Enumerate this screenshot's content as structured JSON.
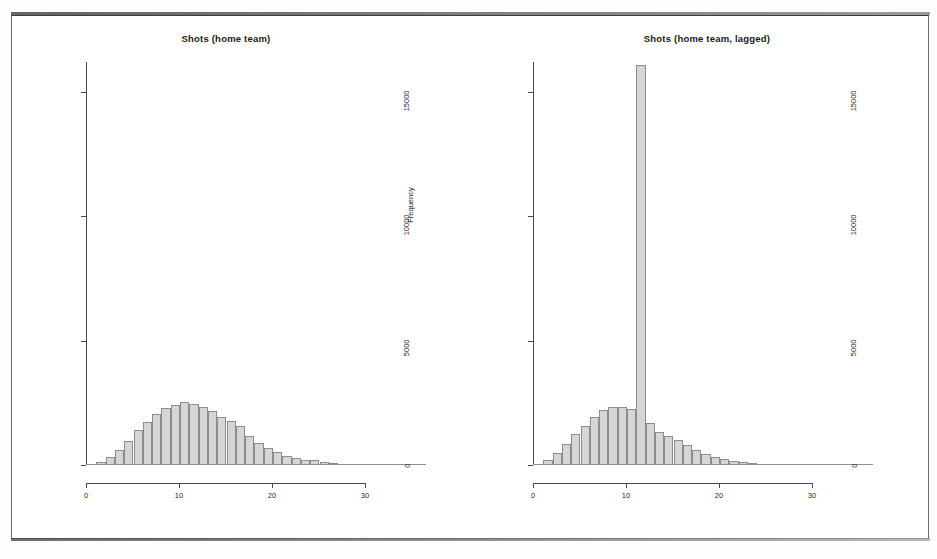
{
  "figure": {
    "background": "#ffffff",
    "frame_color": "#6a6a6a",
    "bar_fill": "#d6d6d6",
    "bar_border": "#8c8c8c",
    "axis_color": "#4a4a4a"
  },
  "chart_data": [
    {
      "type": "bar",
      "id": "shots-home-team",
      "title": "Shots (home team)",
      "xlabel": "",
      "ylabel": "Frequency",
      "xlim": [
        0,
        35.5
      ],
      "ylim": [
        0,
        16200
      ],
      "xticks": [
        0,
        10,
        20,
        30
      ],
      "xtick_labels": [
        "0",
        "10",
        "20",
        "30"
      ],
      "yticks": [
        0,
        5000,
        10000,
        15000
      ],
      "ytick_labels": [
        "0",
        "5000",
        "10000",
        "15000"
      ],
      "grid": false,
      "legend": "none",
      "bin_width": 1,
      "categories": [
        0,
        1,
        2,
        3,
        4,
        5,
        6,
        7,
        8,
        9,
        10,
        11,
        12,
        13,
        14,
        15,
        16,
        17,
        18,
        19,
        20,
        21,
        22,
        23,
        24,
        25,
        26,
        27,
        28,
        29,
        30,
        31,
        32,
        33,
        34,
        35
      ],
      "values": [
        40,
        110,
        330,
        620,
        980,
        1390,
        1720,
        2060,
        2300,
        2430,
        2550,
        2470,
        2330,
        2180,
        1930,
        1760,
        1560,
        1170,
        890,
        690,
        520,
        380,
        300,
        210,
        190,
        110,
        70,
        45,
        30,
        18,
        12,
        8,
        5,
        3,
        2,
        1
      ]
    },
    {
      "type": "bar",
      "id": "shots-home-team-lagged",
      "title": "Shots (home team, lagged)",
      "xlabel": "",
      "ylabel": "Frequency",
      "xlim": [
        0,
        35.5
      ],
      "ylim": [
        0,
        16200
      ],
      "xticks": [
        0,
        10,
        20,
        30
      ],
      "xtick_labels": [
        "0",
        "10",
        "20",
        "30"
      ],
      "yticks": [
        0,
        5000,
        10000,
        15000
      ],
      "ytick_labels": [
        "0",
        "5000",
        "10000",
        "15000"
      ],
      "grid": false,
      "legend": "none",
      "bin_width": 1,
      "spike_bin": 11,
      "spike_clipped": true,
      "categories": [
        0,
        1,
        2,
        3,
        4,
        5,
        6,
        7,
        8,
        9,
        10,
        11,
        12,
        13,
        14,
        15,
        16,
        17,
        18,
        19,
        20,
        21,
        22,
        23,
        24,
        25,
        26,
        27,
        28,
        29,
        30,
        31,
        32,
        33,
        34,
        35
      ],
      "values": [
        60,
        200,
        480,
        830,
        1230,
        1560,
        1940,
        2200,
        2350,
        2340,
        2260,
        16100,
        1700,
        1340,
        1170,
        1020,
        790,
        620,
        430,
        330,
        250,
        180,
        130,
        90,
        60,
        40,
        28,
        18,
        12,
        8,
        5,
        3,
        2,
        1,
        1,
        0
      ]
    }
  ],
  "panels": [
    {
      "title": "Shots (home team)",
      "ylabel": "Frequency"
    },
    {
      "title": "Shots (home team, lagged)",
      "ylabel": "Frequency"
    }
  ]
}
